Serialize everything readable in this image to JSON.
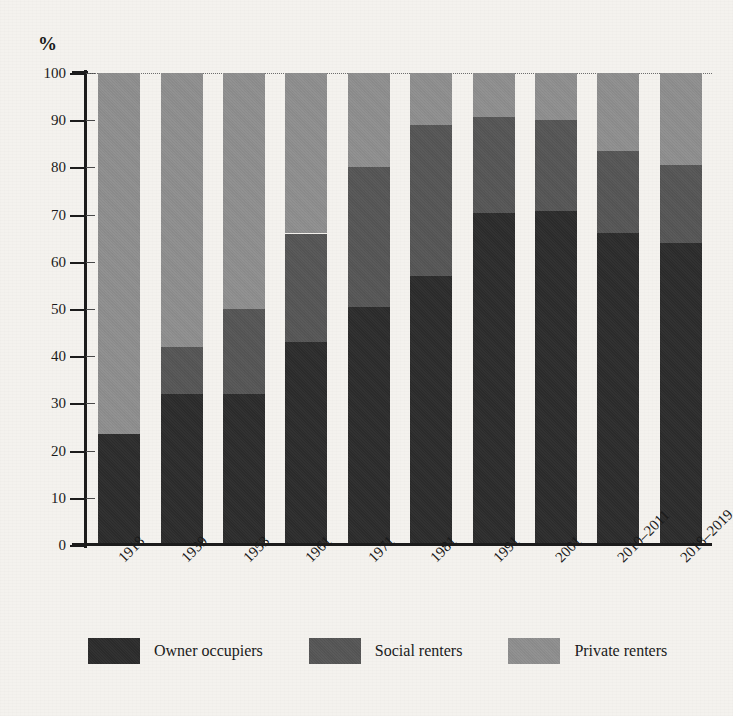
{
  "chart_data": {
    "type": "bar",
    "subtype": "stacked-bar-100-percent",
    "title": "",
    "xlabel": "",
    "ylabel": "%",
    "ylim": [
      0,
      100
    ],
    "y_ticks": [
      0,
      10,
      20,
      30,
      40,
      50,
      60,
      70,
      80,
      90,
      100
    ],
    "grid": "top-dotted-only",
    "legend_position": "bottom",
    "categories": [
      "1918",
      "1939",
      "1953",
      "1961",
      "1971",
      "1981",
      "1991",
      "2001",
      "2010–2011",
      "2018–2019"
    ],
    "series": [
      {
        "name": "Owner occupiers",
        "color": "#2c2c2c",
        "values": [
          23.5,
          32.0,
          32.0,
          43.0,
          50.5,
          57.0,
          70.3,
          70.8,
          66.0,
          64.0
        ]
      },
      {
        "name": "Social renters",
        "color": "#565656",
        "values": [
          0.0,
          10.0,
          18.0,
          23.0,
          29.5,
          32.0,
          20.4,
          19.2,
          17.5,
          16.5
        ]
      },
      {
        "name": "Private renters",
        "color": "#8f8f8f",
        "values": [
          76.5,
          58.0,
          50.0,
          34.0,
          20.0,
          11.0,
          9.3,
          10.0,
          16.5,
          19.5
        ]
      }
    ],
    "cumulative_tops": {
      "owner": [
        23.5,
        32.0,
        32.0,
        43.0,
        50.5,
        57.0,
        70.3,
        70.8,
        66.0,
        64.0
      ],
      "social": [
        23.5,
        42.0,
        50.0,
        66.0,
        80.0,
        89.0,
        90.7,
        90.0,
        83.5,
        80.5
      ],
      "private": [
        100,
        100,
        100,
        100,
        100,
        100,
        100,
        100,
        100,
        100
      ]
    }
  },
  "axis": {
    "y_unit_label": "%",
    "y_tick_labels": [
      "100",
      "90",
      "80",
      "70",
      "60",
      "50",
      "40",
      "30",
      "20",
      "10",
      "0"
    ]
  },
  "legend": {
    "items": [
      {
        "label": "Owner occupiers",
        "color": "#2c2c2c"
      },
      {
        "label": "Social renters",
        "color": "#565656"
      },
      {
        "label": "Private renters",
        "color": "#8f8f8f"
      }
    ]
  }
}
